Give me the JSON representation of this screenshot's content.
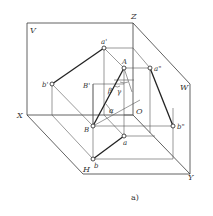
{
  "figure": {
    "caption": "a)",
    "planes": {
      "V": "V",
      "H": "H",
      "W": "W"
    },
    "axes": {
      "X": "X",
      "Y": "Y",
      "Z": "Z",
      "O": "O"
    },
    "points": {
      "A": "A",
      "B": "B",
      "B_prime_aux": "B'",
      "a": "a",
      "b": "b",
      "a_prime": "a'",
      "b_prime": "b'",
      "a_double_prime": "a\"",
      "b_double_prime": "b\""
    },
    "angles": {
      "alpha": "α",
      "beta": "β",
      "gamma": "γ"
    },
    "colors": {
      "line": "#222222",
      "thin_line": "#555555",
      "background": "#ffffff"
    }
  }
}
